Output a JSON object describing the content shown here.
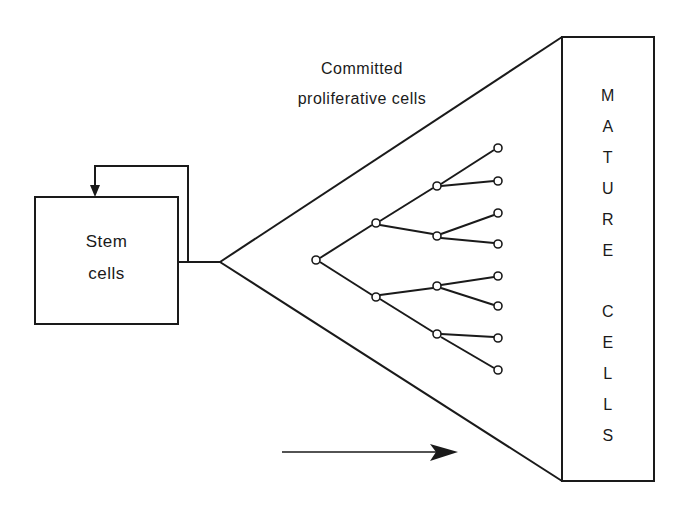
{
  "diagram": {
    "stem_box": {
      "line1": "Stem",
      "line2": "cells"
    },
    "committed_label": {
      "line1": "Committed",
      "line2": "proliferative cells"
    },
    "mature_box": {
      "word1_letters": [
        "M",
        "A",
        "T",
        "U",
        "R",
        "E"
      ],
      "word2_letters": [
        "C",
        "E",
        "L",
        "L",
        "S"
      ]
    },
    "colors": {
      "stroke": "#1a1a1a",
      "background": "#ffffff"
    },
    "tree": {
      "node_radius": 4,
      "levels": [
        [
          {
            "x": 316,
            "y": 260
          }
        ],
        [
          {
            "x": 376,
            "y": 223
          },
          {
            "x": 376,
            "y": 297
          }
        ],
        [
          {
            "x": 437,
            "y": 186
          },
          {
            "x": 437,
            "y": 236
          },
          {
            "x": 437,
            "y": 286
          },
          {
            "x": 437,
            "y": 334
          }
        ],
        [
          {
            "x": 498,
            "y": 148
          },
          {
            "x": 498,
            "y": 181
          },
          {
            "x": 498,
            "y": 213
          },
          {
            "x": 498,
            "y": 244
          },
          {
            "x": 498,
            "y": 276
          },
          {
            "x": 498,
            "y": 306
          },
          {
            "x": 498,
            "y": 338
          },
          {
            "x": 498,
            "y": 370
          }
        ]
      ]
    },
    "flow_arrow": {
      "direction": "right"
    }
  }
}
